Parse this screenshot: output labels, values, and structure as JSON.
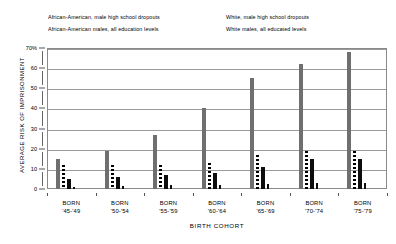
{
  "legend": {
    "items": [
      {
        "label": "African-American, male high school dropouts",
        "marker": "gray-bar-swatch",
        "row": 0,
        "col": 0
      },
      {
        "label": "White, male high school dropouts",
        "marker": "black-bar-swatch",
        "row": 0,
        "col": 1
      },
      {
        "label": "African-American males, all education levels",
        "marker": "dotted-line-swatch",
        "row": 1,
        "col": 0
      },
      {
        "label": "White males, all educated levels",
        "marker": "solid-line-swatch",
        "row": 1,
        "col": 1
      }
    ]
  },
  "chart_data": {
    "type": "bar",
    "title": "",
    "xlabel": "BIRTH COHORT",
    "ylabel": "AVERAGE RISK OF IMPRISONMENT",
    "ylim": [
      0,
      70
    ],
    "yticks": [
      0,
      10,
      20,
      30,
      40,
      50,
      60,
      70
    ],
    "ytick_labels": [
      "0",
      "10",
      "20",
      "30",
      "40",
      "50",
      "60",
      "70%"
    ],
    "grid": true,
    "legend_position": "top",
    "categories": [
      "BORN '45-'49",
      "BORN '50-'54",
      "BORN '55-'59",
      "BORN '60-'64",
      "BORN '65-'69",
      "BORN '70-'74",
      "BORN '75-'79"
    ],
    "category_lines": [
      {
        "line1": "BORN",
        "line2": "'45-'49"
      },
      {
        "line1": "BORN",
        "line2": "'50-'54"
      },
      {
        "line1": "BORN",
        "line2": "'55-'59"
      },
      {
        "line1": "BORN",
        "line2": "'60-'64"
      },
      {
        "line1": "BORN",
        "line2": "'65-'69"
      },
      {
        "line1": "BORN",
        "line2": "'70-'74"
      },
      {
        "line1": "BORN",
        "line2": "'75-'79"
      }
    ],
    "series": [
      {
        "name": "African-American, male high school dropouts",
        "style": "gray-bar",
        "color": "#6f6f6f",
        "values": [
          15,
          19,
          27,
          40,
          55,
          62,
          68
        ]
      },
      {
        "name": "African-American males, all education levels",
        "style": "dotted-bar",
        "color": "#000000",
        "values": [
          12,
          12,
          12,
          13,
          17,
          19,
          19
        ]
      },
      {
        "name": "White, male high school dropouts",
        "style": "black-bar",
        "color": "#0d0d0d",
        "values": [
          5,
          6,
          7,
          8,
          11,
          15,
          15
        ]
      },
      {
        "name": "White males, all educated levels",
        "style": "thin-solid-bar",
        "color": "#0d0d0d",
        "values": [
          1,
          1.5,
          2,
          2,
          2.5,
          3,
          3
        ]
      }
    ]
  }
}
